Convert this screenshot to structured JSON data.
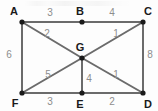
{
  "figure": {
    "name": "weighted-graph-diagram",
    "width": 158,
    "height": 111,
    "background_color": "#fdfdfd",
    "edge_color": "#6b6b6b",
    "vertex_color": "#1a1a1a",
    "vertex_label_color": "#1a1a1a",
    "weight_label_color": "#8d8d8d"
  },
  "chart_data": {
    "type": "diagram",
    "title": "",
    "nodes": [
      {
        "id": "A",
        "label": "A",
        "x": 22,
        "y": 22,
        "label_x": 14,
        "label_y": 11
      },
      {
        "id": "B",
        "label": "B",
        "x": 82,
        "y": 22,
        "label_x": 80,
        "label_y": 11
      },
      {
        "id": "C",
        "label": "C",
        "x": 143,
        "y": 22,
        "label_x": 148,
        "label_y": 11
      },
      {
        "id": "G",
        "label": "G",
        "x": 82,
        "y": 58,
        "label_x": 80,
        "label_y": 47
      },
      {
        "id": "F",
        "label": "F",
        "x": 22,
        "y": 93,
        "label_x": 15,
        "label_y": 103
      },
      {
        "id": "E",
        "label": "E",
        "x": 82,
        "y": 93,
        "label_x": 80,
        "label_y": 104
      },
      {
        "id": "D",
        "label": "D",
        "x": 143,
        "y": 93,
        "label_x": 148,
        "label_y": 104
      }
    ],
    "edges": [
      {
        "id": "AB",
        "source": "A",
        "target": "B",
        "weight": "3",
        "label_x": 50,
        "label_y": 13
      },
      {
        "id": "BC",
        "source": "B",
        "target": "C",
        "weight": "4",
        "label_x": 112,
        "label_y": 13
      },
      {
        "id": "AF",
        "source": "A",
        "target": "F",
        "weight": "6",
        "label_x": 9,
        "label_y": 55
      },
      {
        "id": "CD",
        "source": "C",
        "target": "D",
        "weight": "8",
        "label_x": 150,
        "label_y": 55
      },
      {
        "id": "FE",
        "source": "F",
        "target": "E",
        "weight": "3",
        "label_x": 50,
        "label_y": 102
      },
      {
        "id": "ED",
        "source": "E",
        "target": "D",
        "weight": "2",
        "label_x": 112,
        "label_y": 102
      },
      {
        "id": "AG",
        "source": "A",
        "target": "G",
        "weight": "2",
        "label_x": 47,
        "label_y": 34
      },
      {
        "id": "GC",
        "source": "G",
        "target": "C",
        "weight": "1",
        "label_x": 116,
        "label_y": 34
      },
      {
        "id": "FG",
        "source": "F",
        "target": "G",
        "weight": "5",
        "label_x": 48,
        "label_y": 75
      },
      {
        "id": "GE",
        "source": "G",
        "target": "E",
        "weight": "4",
        "label_x": 89,
        "label_y": 79
      },
      {
        "id": "GD",
        "source": "G",
        "target": "D",
        "weight": "1",
        "label_x": 116,
        "label_y": 75
      }
    ],
    "xlabel": "",
    "ylabel": "",
    "legend": []
  }
}
